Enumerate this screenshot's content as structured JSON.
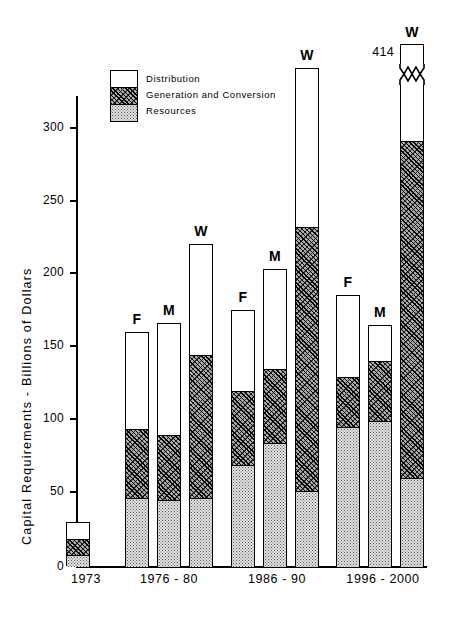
{
  "chart_data": {
    "type": "bar",
    "title": "",
    "xlabel": "",
    "ylabel": "Capital Requirements - Billions of Dollars",
    "ylim": [
      0,
      340
    ],
    "ytick_values": [
      0,
      50,
      100,
      150,
      200,
      250,
      300
    ],
    "ytick_labels": [
      "0",
      "50",
      "100",
      "150",
      "200",
      "250",
      "300"
    ],
    "grid": false,
    "legend_position": "upper-left-inside",
    "stack_order_bottom_to_top": [
      "Resources",
      "Generation and Conversion",
      "Distribution"
    ],
    "legend": [
      {
        "key": "distribution",
        "label": "Distribution",
        "fill": "white"
      },
      {
        "key": "generation",
        "label": "Generation and Conversion",
        "fill": "hatch"
      },
      {
        "key": "resources",
        "label": "Resources",
        "fill": "stipple"
      }
    ],
    "categories": [
      "1973",
      "1976 - 80",
      "1986 - 90",
      "1996 - 2000"
    ],
    "bars": [
      {
        "group": "1973",
        "tag": "",
        "total": 30,
        "resources": 8,
        "generation": 11,
        "distribution": 11,
        "broken": false
      },
      {
        "group": "1976 - 80",
        "tag": "F",
        "total": 160,
        "resources": 47,
        "generation": 47,
        "distribution": 66,
        "broken": false
      },
      {
        "group": "1976 - 80",
        "tag": "M",
        "total": 166,
        "resources": 46,
        "generation": 44,
        "distribution": 76,
        "broken": false
      },
      {
        "group": "1976 - 80",
        "tag": "W",
        "total": 220,
        "resources": 47,
        "generation": 98,
        "distribution": 75,
        "broken": false
      },
      {
        "group": "1986 - 90",
        "tag": "F",
        "total": 175,
        "resources": 70,
        "generation": 50,
        "distribution": 55,
        "broken": false
      },
      {
        "group": "1986 - 90",
        "tag": "M",
        "total": 203,
        "resources": 85,
        "generation": 50,
        "distribution": 68,
        "broken": false
      },
      {
        "group": "1986 - 90",
        "tag": "W",
        "total": 340,
        "resources": 52,
        "generation": 180,
        "distribution": 108,
        "broken": false
      },
      {
        "group": "1996 - 2000",
        "tag": "F",
        "total": 185,
        "resources": 96,
        "generation": 34,
        "distribution": 55,
        "broken": false
      },
      {
        "group": "1996 - 2000",
        "tag": "M",
        "total": 165,
        "resources": 100,
        "generation": 41,
        "distribution": 24,
        "broken": false
      },
      {
        "group": "1996 - 2000",
        "tag": "W",
        "total": 414,
        "resources": 61,
        "generation": 230,
        "distribution": 123,
        "broken": true,
        "break_label": "414"
      }
    ]
  }
}
